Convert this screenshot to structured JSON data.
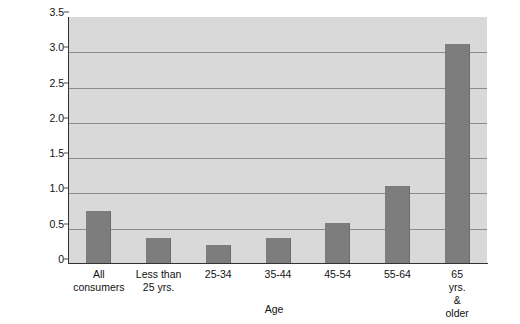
{
  "chart_data": {
    "type": "bar",
    "title": "",
    "xlabel": "Age",
    "ylabel": "Percent",
    "categories": [
      "All\nconsumers",
      "Less than\n25 yrs.",
      "25-34",
      "35-44",
      "45-54",
      "55-64",
      "65 yrs.\n& older"
    ],
    "values": [
      0.75,
      0.37,
      0.27,
      0.37,
      0.58,
      1.1,
      3.12
    ],
    "ylim": [
      0,
      3.5
    ],
    "yticks": [
      0,
      0.5,
      1.0,
      1.5,
      2.0,
      2.5,
      3.0,
      3.5
    ],
    "ytick_labels": [
      "0",
      "0.5",
      "1.0",
      "1.5",
      "2.0",
      "2.5",
      "3.0",
      "3.5"
    ],
    "grid": true,
    "legend": false,
    "bar_color": "#7d7d7d",
    "plot_background": "#d9d9d9",
    "gridline_color": "#8a8a8a",
    "axis_color": "#333333"
  }
}
